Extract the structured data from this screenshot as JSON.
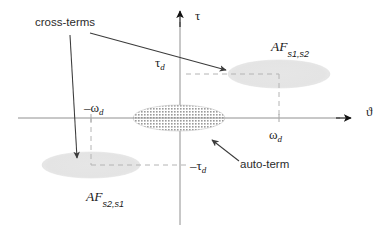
{
  "figure": {
    "title_visible": false,
    "background": "#ffffff",
    "axes": {
      "vertical_label": "τ",
      "horizontal_label": "ϑ",
      "origin_x": 180,
      "origin_y": 118,
      "line_color": "#8a8a8a",
      "arrow_color": "#1a1a1a"
    },
    "labels": {
      "cross_terms": "cross-terms",
      "auto_term": "auto-term",
      "tau_d_pos_main": "τ",
      "tau_d_pos_sub": "d",
      "tau_d_neg_main": "–τ",
      "tau_d_neg_sub": "d",
      "omega_d_pos_main": "ω",
      "omega_d_pos_sub": "d",
      "omega_d_neg_main": "–ω",
      "omega_d_neg_sub": "d",
      "af_s1s2_main": "AF",
      "af_s1s2_sub": "s1,s2",
      "af_s2s1_main": "AF",
      "af_s2s1_sub": "s2,s1"
    },
    "blobs": {
      "auto_term": {
        "name": "auto-term-ellipse",
        "cx": 179,
        "cy": 118,
        "rx": 46,
        "ry": 13,
        "fill": "#9f9f9f",
        "texture": "dotted"
      },
      "cross_upper_right": {
        "name": "cross-term-ellipse-upper-right",
        "cx": 279,
        "cy": 74,
        "rx": 51,
        "ry": 14,
        "fill": "#e2e2e2",
        "texture": "plain"
      },
      "cross_lower_left": {
        "name": "cross-term-ellipse-lower-left",
        "cx": 91,
        "cy": 165,
        "rx": 49,
        "ry": 13,
        "fill": "#e2e2e2",
        "texture": "plain"
      }
    },
    "guides": {
      "dash_color": "#b4b4b4",
      "upper_horizontal_from_x": 186,
      "upper_horizontal_to_x": 279,
      "upper_horizontal_y": 74,
      "upper_vertical_x": 279,
      "upper_vertical_from_y": 74,
      "upper_vertical_to_y": 118,
      "lower_horizontal_from_x": 91,
      "lower_horizontal_to_x": 190,
      "lower_horizontal_y": 165,
      "lower_vertical_x": 91,
      "lower_vertical_from_y": 118,
      "lower_vertical_to_y": 165
    },
    "annotation_arrows": {
      "cross_terms_diagonal": {
        "name": "cross-terms-arrow-to-upper-right",
        "x1": 90,
        "y1": 33,
        "x2": 229,
        "y2": 71
      },
      "cross_terms_vertical": {
        "name": "cross-terms-arrow-to-lower-left",
        "x1": 70,
        "y1": 35,
        "x2": 77,
        "y2": 161
      },
      "auto_term_arrow": {
        "name": "auto-term-arrow",
        "x1": 238,
        "y1": 160,
        "x2": 211,
        "y2": 139
      }
    }
  }
}
